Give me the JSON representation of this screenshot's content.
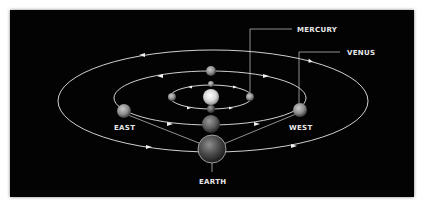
{
  "diagram": {
    "title": "",
    "labels": {
      "mercury": "MERCURY",
      "venus": "VENUS",
      "east": "EAST",
      "west": "WEST",
      "earth": "EARTH"
    },
    "colors": {
      "background": "#030303",
      "orbit": "#e6e6e6",
      "text": "#e8e8e8",
      "frame": "#ffffff"
    },
    "orbits": [
      {
        "name": "inner-orbit",
        "cx": 211,
        "cy": 97,
        "rx": 41,
        "ry": 12
      },
      {
        "name": "middle-orbit",
        "cx": 210,
        "cy": 98,
        "rx": 96,
        "ry": 27
      },
      {
        "name": "outer-orbit",
        "cx": 213,
        "cy": 101,
        "rx": 155,
        "ry": 51
      }
    ],
    "bodies": [
      {
        "name": "sun",
        "x": 211,
        "y": 97,
        "r": 8
      },
      {
        "name": "mercury-top",
        "x": 211,
        "y": 84,
        "r": 3
      },
      {
        "name": "mercury-bottom",
        "x": 211,
        "y": 109,
        "r": 4
      },
      {
        "name": "mercury-left",
        "x": 172,
        "y": 97,
        "r": 4
      },
      {
        "name": "mercury-right",
        "x": 250,
        "y": 97,
        "r": 4
      },
      {
        "name": "venus-top",
        "x": 211,
        "y": 71,
        "r": 5
      },
      {
        "name": "venus-east",
        "x": 124,
        "y": 111,
        "r": 7
      },
      {
        "name": "venus-west",
        "x": 300,
        "y": 110,
        "r": 7
      },
      {
        "name": "venus-bottom",
        "x": 211,
        "y": 124,
        "r": 9
      },
      {
        "name": "earth",
        "x": 212,
        "y": 149,
        "r": 14
      }
    ]
  }
}
